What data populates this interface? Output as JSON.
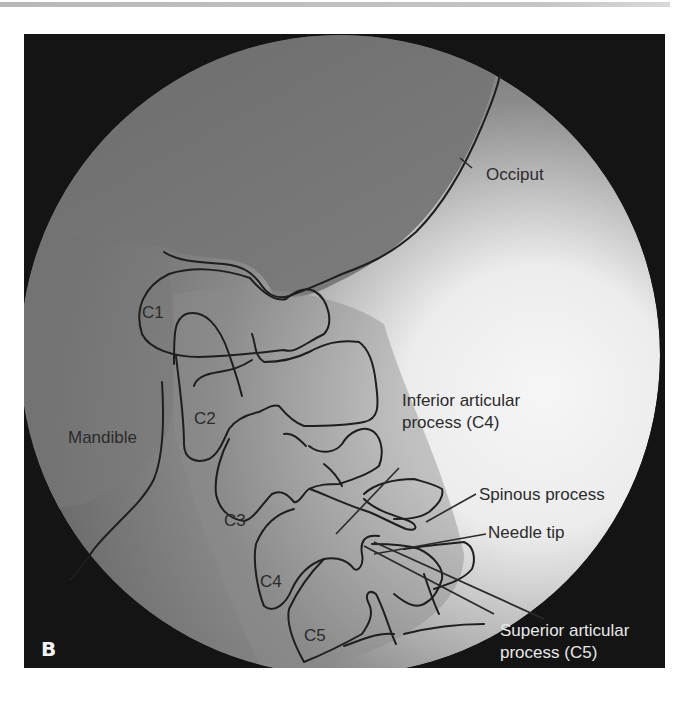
{
  "figure": {
    "panel_label": "B",
    "colors": {
      "frame_background": "#141414",
      "field_dark": "#6e6e6e",
      "field_light": "#f4f4f4",
      "outline": "#1e1e1e",
      "label_dark": "#2b2b2b",
      "label_light": "#e8e8e8"
    },
    "vertebra_labels": [
      "C1",
      "C2",
      "C3",
      "C4",
      "C5"
    ],
    "annotations": {
      "occiput": "Occiput",
      "mandible": "Mandible",
      "inferior_articular_line1": "Inferior articular",
      "inferior_articular_line2": "process (C4)",
      "spinous_process": "Spinous process",
      "needle_tip": "Needle tip",
      "superior_articular_line1": "Superior articular",
      "superior_articular_line2": "process (C5)"
    }
  }
}
